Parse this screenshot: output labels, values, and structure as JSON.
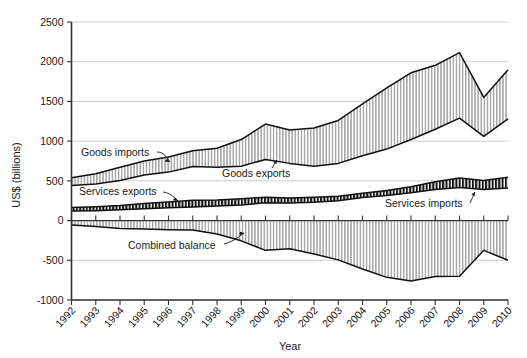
{
  "chart_data": {
    "type": "area",
    "title": "",
    "xlabel": "Year",
    "ylabel": "US$ (billions)",
    "ylim": [
      -1000,
      2500
    ],
    "ytick_values": [
      2500,
      2000,
      1500,
      1000,
      500,
      0,
      -500,
      -1000
    ],
    "ytick_labels": [
      "2500",
      "2000",
      "1500",
      "1000",
      "500",
      "0",
      "-500",
      "-1000"
    ],
    "grid": true,
    "legend": "annotations-inline",
    "x": [
      1992,
      1993,
      1994,
      1995,
      1996,
      1997,
      1998,
      1999,
      2000,
      2001,
      2002,
      2003,
      2004,
      2005,
      2006,
      2007,
      2008,
      2009,
      2010
    ],
    "xtick_labels": [
      "1992",
      "1993",
      "1994",
      "1995",
      "1996",
      "1997",
      "1998",
      "1999",
      "2000",
      "2001",
      "2002",
      "2003",
      "2004",
      "2005",
      "2006",
      "2007",
      "2008",
      "2009",
      "2010"
    ],
    "series": [
      {
        "name": "Goods exports",
        "fill": "vertical-hatch-light",
        "values": [
          440,
          460,
          505,
          575,
          610,
          680,
          670,
          685,
          770,
          720,
          685,
          720,
          815,
          900,
          1020,
          1150,
          1290,
          1060,
          1280
        ]
      },
      {
        "name": "Goods imports",
        "fill": "vertical-hatch-light",
        "values": [
          540,
          590,
          670,
          750,
          800,
          880,
          910,
          1020,
          1215,
          1140,
          1165,
          1260,
          1470,
          1670,
          1860,
          1955,
          2115,
          1550,
          1900
        ]
      },
      {
        "name": "Services exports",
        "fill": "vertical-hatch-dark",
        "values": [
          165,
          175,
          190,
          215,
          235,
          255,
          260,
          275,
          295,
          285,
          295,
          305,
          345,
          380,
          425,
          490,
          535,
          505,
          545
        ]
      },
      {
        "name": "Services imports",
        "fill": "vertical-hatch-dark",
        "values": [
          120,
          125,
          135,
          150,
          160,
          170,
          185,
          195,
          225,
          220,
          230,
          250,
          290,
          315,
          350,
          390,
          415,
          390,
          410
        ]
      },
      {
        "name": "Combined balance",
        "fill": "vertical-hatch-light",
        "values": [
          -55,
          -75,
          -100,
          -105,
          -115,
          -120,
          -170,
          -255,
          -375,
          -355,
          -420,
          -495,
          -610,
          -715,
          -760,
          -705,
          -700,
          -375,
          -500
        ]
      }
    ],
    "annotations": [
      {
        "id": "goods-imports",
        "label": "Goods imports"
      },
      {
        "id": "goods-exports",
        "label": "Goods exports"
      },
      {
        "id": "services-exports",
        "label": "Services exports"
      },
      {
        "id": "services-imports",
        "label": "Services imports"
      },
      {
        "id": "combined-balance",
        "label": "Combined balance"
      }
    ]
  },
  "axes": {
    "ylabel": "US$ (billions)",
    "xlabel": "Year"
  },
  "colors": {
    "background": "#ffffff",
    "grid": "#c9c9c9",
    "axis": "#333333",
    "outline": "#111111",
    "hatch_light": "#9b9b9b",
    "hatch_dark": "#1a1a1a",
    "fill_light": "#d8d8d8",
    "fill_dark": "#ffffff"
  }
}
